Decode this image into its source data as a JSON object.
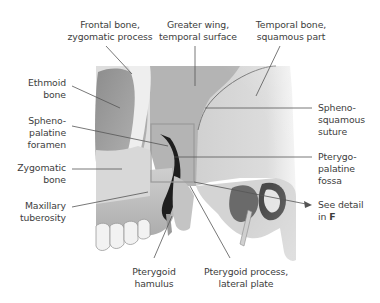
{
  "figure": {
    "detail_box_ref": "F"
  },
  "labels": {
    "frontal_bone": {
      "line1": "Frontal bone,",
      "line2": "zygomatic process"
    },
    "greater_wing": {
      "line1": "Greater wing,",
      "line2": "temporal surface"
    },
    "temporal_bone": {
      "line1": "Temporal bone,",
      "line2": "squamous part"
    },
    "ethmoid_bone": {
      "line1": "Ethmoid",
      "line2": "bone"
    },
    "sphenopalatine_foramen": {
      "line1": "Spheno-",
      "line2": "palatine",
      "line3": "foramen"
    },
    "zygomatic_bone": {
      "line1": "Zygomatic",
      "line2": "bone"
    },
    "maxillary_tuberosity": {
      "line1": "Maxillary",
      "line2": "tuberosity"
    },
    "sphenosquamous_suture": {
      "line1": "Spheno-",
      "line2": "squamous",
      "line3": "suture"
    },
    "pterygopalatine_fossa": {
      "line1": "Pterygo-",
      "line2": "palatine",
      "line3": "fossa"
    },
    "see_detail": {
      "line1": "See detail",
      "line2_prefix": "in ",
      "line2_ref": "F"
    },
    "pterygoid_hamulus": {
      "line1": "Pterygoid",
      "line2": "hamulus"
    },
    "pterygoid_lateral_plate": {
      "line1": "Pterygoid process,",
      "line2": "lateral plate"
    }
  },
  "colors": {
    "leader_line": "#555555",
    "detail_box": "#9a9a9a",
    "bone_light": "#e6e6e6",
    "bone_mid": "#bdbdbd",
    "bone_dark": "#5a5a5a",
    "shadow": "#1e1e1e"
  }
}
